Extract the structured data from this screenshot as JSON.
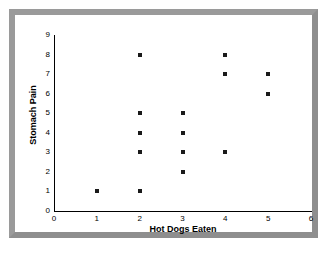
{
  "chart_data": {
    "type": "scatter",
    "title": "",
    "xlabel": "Hot Dogs Eaten",
    "ylabel": "Stomach Pain",
    "xlim": [
      0,
      6
    ],
    "ylim": [
      0,
      9
    ],
    "xticks": [
      "0",
      "1",
      "2",
      "3",
      "4",
      "5",
      "6"
    ],
    "yticks": [
      "0",
      "1",
      "2",
      "3",
      "4",
      "5",
      "6",
      "7",
      "8",
      "9"
    ],
    "grid": false,
    "legend": null,
    "marker_color": "#1a1a1a",
    "marker_shape": "square",
    "points": [
      {
        "x": 1,
        "y": 1
      },
      {
        "x": 2,
        "y": 8
      },
      {
        "x": 2,
        "y": 5
      },
      {
        "x": 2,
        "y": 4
      },
      {
        "x": 2,
        "y": 3
      },
      {
        "x": 2,
        "y": 1
      },
      {
        "x": 3,
        "y": 5
      },
      {
        "x": 3,
        "y": 4
      },
      {
        "x": 3,
        "y": 3
      },
      {
        "x": 3,
        "y": 2
      },
      {
        "x": 4,
        "y": 8
      },
      {
        "x": 4,
        "y": 7
      },
      {
        "x": 4,
        "y": 3
      },
      {
        "x": 5,
        "y": 7
      },
      {
        "x": 5,
        "y": 6
      }
    ]
  },
  "figure": {
    "frame_color": "#9a9a9a",
    "background_color": "#ffffff",
    "axis_color": "#000000"
  }
}
